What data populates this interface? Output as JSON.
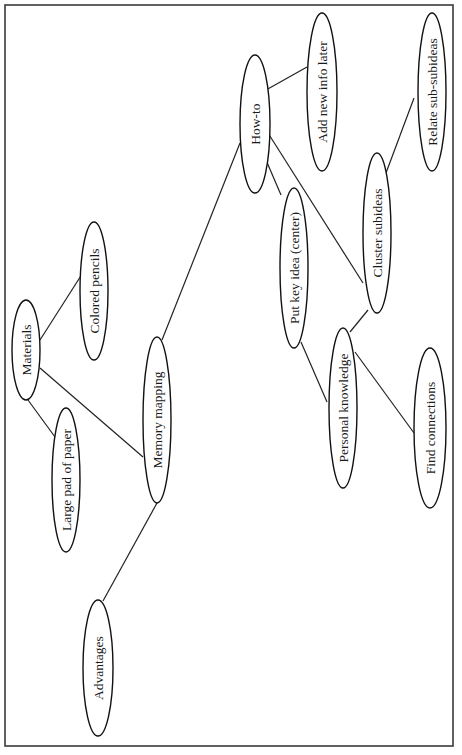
{
  "diagram": {
    "type": "mind-map",
    "orientation": "rotated-90-ccw",
    "colors": {
      "stroke": "#111111",
      "frame": "#3a3a3a",
      "background": "#ffffff",
      "text": "#1a1a1a"
    },
    "frame": {
      "x": 5,
      "y": 5,
      "width": 448,
      "height": 741
    },
    "nodes": [
      {
        "id": "materials",
        "label": "Materials",
        "cx": 26,
        "cy": 350,
        "rx": 14,
        "ry": 50
      },
      {
        "id": "colored-pencils",
        "label": "Colored pencils",
        "cx": 94,
        "cy": 291,
        "rx": 14,
        "ry": 69
      },
      {
        "id": "large-pad-of-paper",
        "label": "Large pad of paper",
        "cx": 66,
        "cy": 480,
        "rx": 14,
        "ry": 72
      },
      {
        "id": "memory-mapping",
        "label": "Memory mapping",
        "cx": 157,
        "cy": 420,
        "rx": 14,
        "ry": 83
      },
      {
        "id": "advantages",
        "label": "Advantages",
        "cx": 98,
        "cy": 668,
        "rx": 15,
        "ry": 68
      },
      {
        "id": "how-to",
        "label": "How-to",
        "cx": 255,
        "cy": 124,
        "rx": 15,
        "ry": 69
      },
      {
        "id": "add-new-info-later",
        "label": "Add new info later",
        "cx": 322,
        "cy": 92,
        "rx": 15,
        "ry": 79
      },
      {
        "id": "relate-sub-subideas",
        "label": "Relate sub-subideas",
        "cx": 432,
        "cy": 92,
        "rx": 14,
        "ry": 79
      },
      {
        "id": "put-key-idea",
        "label": "Put key idea (center)",
        "cx": 294,
        "cy": 268,
        "rx": 14,
        "ry": 80
      },
      {
        "id": "cluster-subideas",
        "label": "Cluster subideas",
        "cx": 377,
        "cy": 233,
        "rx": 14,
        "ry": 80
      },
      {
        "id": "personal-knowledge",
        "label": "Personal knowledge",
        "cx": 343,
        "cy": 408,
        "rx": 14,
        "ry": 80
      },
      {
        "id": "find-connections",
        "label": "Find connections",
        "cx": 430,
        "cy": 428,
        "rx": 16,
        "ry": 80
      }
    ],
    "edges": [
      {
        "from": "materials",
        "to": "colored-pencils",
        "x1": 40,
        "y1": 340,
        "x2": 84,
        "y2": 271
      },
      {
        "from": "materials",
        "to": "large-pad-of-paper",
        "x1": 28,
        "y1": 400,
        "x2": 55,
        "y2": 437
      },
      {
        "from": "materials",
        "to": "memory-mapping",
        "x1": 40,
        "y1": 368,
        "x2": 143,
        "y2": 457
      },
      {
        "from": "memory-mapping",
        "to": "how-to",
        "x1": 162,
        "y1": 340,
        "x2": 240,
        "y2": 143
      },
      {
        "from": "memory-mapping",
        "to": "advantages",
        "x1": 157,
        "y1": 503,
        "x2": 103,
        "y2": 601
      },
      {
        "from": "how-to",
        "to": "add-new-info-later",
        "x1": 266,
        "y1": 90,
        "x2": 307,
        "y2": 67
      },
      {
        "from": "how-to",
        "to": "put-key-idea",
        "x1": 266,
        "y1": 160,
        "x2": 281,
        "y2": 195
      },
      {
        "from": "how-to",
        "to": "cluster-subideas",
        "x1": 268,
        "y1": 133,
        "x2": 363,
        "y2": 283
      },
      {
        "from": "cluster-subideas",
        "to": "relate-sub-subideas",
        "x1": 386,
        "y1": 173,
        "x2": 414,
        "y2": 98
      },
      {
        "from": "put-key-idea",
        "to": "personal-knowledge",
        "x1": 301,
        "y1": 342,
        "x2": 327,
        "y2": 402
      },
      {
        "from": "personal-knowledge",
        "to": "cluster-subideas",
        "x1": 350,
        "y1": 332,
        "x2": 368,
        "y2": 310
      },
      {
        "from": "personal-knowledge",
        "to": "find-connections",
        "x1": 355,
        "y1": 352,
        "x2": 414,
        "y2": 433
      }
    ]
  }
}
